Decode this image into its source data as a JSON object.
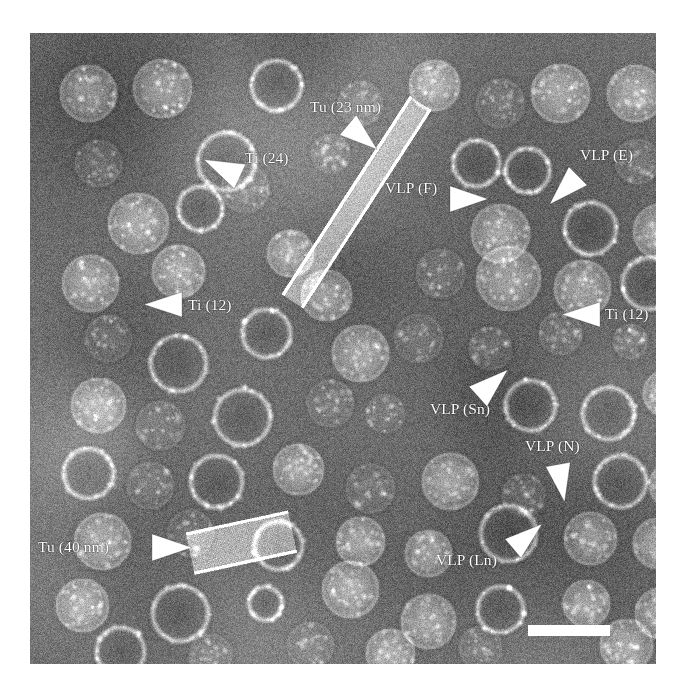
{
  "figure": {
    "type": "negative-stain-transmission-electron-micrograph",
    "plate": {
      "x": 30,
      "y": 33,
      "width": 626,
      "height": 631,
      "background_hex": "#6f6f6f",
      "border_hex": "#ffffff"
    },
    "annotation_color_hex": "#ffffff"
  },
  "annotations": [
    {
      "id": "tu-23nm",
      "label": "Tu (23 nm)",
      "text_x": 310,
      "text_y": 99,
      "arrow": {
        "x": 348,
        "y": 112,
        "angle": 40,
        "length": 38,
        "width": 26
      }
    },
    {
      "id": "ti-24",
      "label": "Ti (24)",
      "text_x": 245,
      "text_y": 150,
      "arrow": {
        "x": 240,
        "y": 163,
        "angle": 205,
        "length": 40,
        "width": 27
      }
    },
    {
      "id": "vlp-f",
      "label": "VLP (F)",
      "text_x": 385,
      "text_y": 180,
      "arrow": {
        "x": 450,
        "y": 186,
        "angle": 0,
        "length": 38,
        "width": 26
      }
    },
    {
      "id": "vlp-e",
      "label": "VLP (E)",
      "text_x": 580,
      "text_y": 147,
      "arrow": {
        "x": 578,
        "y": 163,
        "angle": 135,
        "length": 40,
        "width": 26
      }
    },
    {
      "id": "ti-12-left",
      "label": "Ti (12)",
      "text_x": 188,
      "text_y": 297,
      "arrow": {
        "x": 182,
        "y": 292,
        "angle": 180,
        "length": 38,
        "width": 25
      }
    },
    {
      "id": "ti-12-right",
      "label": "Ti (12)",
      "text_x": 605,
      "text_y": 306,
      "arrow": {
        "x": 600,
        "y": 302,
        "angle": 180,
        "length": 38,
        "width": 25
      }
    },
    {
      "id": "vlp-sn",
      "label": "VLP (Sn)",
      "text_x": 430,
      "text_y": 401,
      "arrow": {
        "x": 478,
        "y": 383,
        "angle": 318,
        "length": 40,
        "width": 27
      }
    },
    {
      "id": "vlp-n",
      "label": "VLP (N)",
      "text_x": 525,
      "text_y": 438,
      "arrow": {
        "x": 558,
        "y": 452,
        "angle": 80,
        "length": 38,
        "width": 25
      }
    },
    {
      "id": "vlp-ln",
      "label": "VLP (Ln)",
      "text_x": 436,
      "text_y": 552,
      "arrow": {
        "x": 513,
        "y": 536,
        "angle": 320,
        "length": 38,
        "width": 25
      }
    },
    {
      "id": "tu-40nm",
      "label": "Tu (40 nm)",
      "text_x": 38,
      "text_y": 539,
      "arrow": {
        "x": 152,
        "y": 534,
        "angle": 0,
        "length": 40,
        "width": 27
      }
    }
  ],
  "scale_bar": {
    "x": 528,
    "y": 625,
    "width": 82,
    "height": 11,
    "color_hex": "#ffffff",
    "label": ""
  },
  "micrograph_content": {
    "background_levels": {
      "mean": 112,
      "noise_sigma": 26
    },
    "particle_kinds": {
      "filled": "bright granular virus-like particle (stain-excluded core)",
      "ring": "annular / empty particle (stain-penetrated centre, bright rim)",
      "faint": "small low-contrast particle"
    },
    "particles": [
      {
        "cx": 58,
        "cy": 60,
        "r": 29,
        "kind": "filled"
      },
      {
        "cx": 132,
        "cy": 55,
        "r": 30,
        "kind": "filled"
      },
      {
        "cx": 246,
        "cy": 52,
        "r": 27,
        "kind": "ring"
      },
      {
        "cx": 330,
        "cy": 70,
        "r": 23,
        "kind": "faint"
      },
      {
        "cx": 404,
        "cy": 52,
        "r": 26,
        "kind": "filled"
      },
      {
        "cx": 470,
        "cy": 70,
        "r": 25,
        "kind": "faint"
      },
      {
        "cx": 530,
        "cy": 60,
        "r": 30,
        "kind": "filled"
      },
      {
        "cx": 605,
        "cy": 60,
        "r": 29,
        "kind": "filled"
      },
      {
        "cx": 68,
        "cy": 130,
        "r": 24,
        "kind": "faint"
      },
      {
        "cx": 196,
        "cy": 128,
        "r": 31,
        "kind": "ring"
      },
      {
        "cx": 300,
        "cy": 120,
        "r": 20,
        "kind": "faint"
      },
      {
        "cx": 446,
        "cy": 130,
        "r": 25,
        "kind": "ring"
      },
      {
        "cx": 497,
        "cy": 137,
        "r": 24,
        "kind": "ring"
      },
      {
        "cx": 607,
        "cy": 128,
        "r": 23,
        "kind": "faint"
      },
      {
        "cx": 108,
        "cy": 190,
        "r": 31,
        "kind": "filled"
      },
      {
        "cx": 170,
        "cy": 175,
        "r": 24,
        "kind": "ring"
      },
      {
        "cx": 215,
        "cy": 155,
        "r": 25,
        "kind": "faint"
      },
      {
        "cx": 470,
        "cy": 200,
        "r": 30,
        "kind": "filled"
      },
      {
        "cx": 560,
        "cy": 195,
        "r": 28,
        "kind": "ring"
      },
      {
        "cx": 630,
        "cy": 198,
        "r": 28,
        "kind": "filled"
      },
      {
        "cx": 60,
        "cy": 250,
        "r": 29,
        "kind": "filled"
      },
      {
        "cx": 148,
        "cy": 238,
        "r": 27,
        "kind": "filled"
      },
      {
        "cx": 296,
        "cy": 262,
        "r": 26,
        "kind": "filled"
      },
      {
        "cx": 410,
        "cy": 240,
        "r": 25,
        "kind": "faint"
      },
      {
        "cx": 478,
        "cy": 245,
        "r": 33,
        "kind": "filled"
      },
      {
        "cx": 552,
        "cy": 255,
        "r": 29,
        "kind": "filled"
      },
      {
        "cx": 618,
        "cy": 250,
        "r": 28,
        "kind": "ring"
      },
      {
        "cx": 78,
        "cy": 305,
        "r": 24,
        "kind": "faint"
      },
      {
        "cx": 148,
        "cy": 330,
        "r": 30,
        "kind": "ring"
      },
      {
        "cx": 236,
        "cy": 300,
        "r": 26,
        "kind": "ring"
      },
      {
        "cx": 330,
        "cy": 320,
        "r": 29,
        "kind": "filled"
      },
      {
        "cx": 388,
        "cy": 305,
        "r": 25,
        "kind": "faint"
      },
      {
        "cx": 460,
        "cy": 315,
        "r": 22,
        "kind": "faint"
      },
      {
        "cx": 530,
        "cy": 300,
        "r": 22,
        "kind": "faint"
      },
      {
        "cx": 600,
        "cy": 308,
        "r": 18,
        "kind": "faint"
      },
      {
        "cx": 68,
        "cy": 372,
        "r": 28,
        "kind": "filled"
      },
      {
        "cx": 130,
        "cy": 392,
        "r": 25,
        "kind": "faint"
      },
      {
        "cx": 212,
        "cy": 384,
        "r": 30,
        "kind": "ring"
      },
      {
        "cx": 300,
        "cy": 370,
        "r": 24,
        "kind": "faint"
      },
      {
        "cx": 355,
        "cy": 380,
        "r": 20,
        "kind": "faint"
      },
      {
        "cx": 500,
        "cy": 372,
        "r": 27,
        "kind": "ring"
      },
      {
        "cx": 578,
        "cy": 380,
        "r": 28,
        "kind": "ring"
      },
      {
        "cx": 636,
        "cy": 360,
        "r": 24,
        "kind": "filled"
      },
      {
        "cx": 58,
        "cy": 440,
        "r": 27,
        "kind": "ring"
      },
      {
        "cx": 120,
        "cy": 452,
        "r": 24,
        "kind": "faint"
      },
      {
        "cx": 186,
        "cy": 448,
        "r": 28,
        "kind": "ring"
      },
      {
        "cx": 268,
        "cy": 436,
        "r": 26,
        "kind": "filled"
      },
      {
        "cx": 340,
        "cy": 455,
        "r": 25,
        "kind": "faint"
      },
      {
        "cx": 420,
        "cy": 448,
        "r": 29,
        "kind": "filled"
      },
      {
        "cx": 493,
        "cy": 462,
        "r": 22,
        "kind": "faint"
      },
      {
        "cx": 590,
        "cy": 448,
        "r": 28,
        "kind": "ring"
      },
      {
        "cx": 642,
        "cy": 452,
        "r": 24,
        "kind": "filled"
      },
      {
        "cx": 72,
        "cy": 508,
        "r": 29,
        "kind": "filled"
      },
      {
        "cx": 160,
        "cy": 500,
        "r": 24,
        "kind": "faint"
      },
      {
        "cx": 248,
        "cy": 512,
        "r": 26,
        "kind": "ring"
      },
      {
        "cx": 330,
        "cy": 508,
        "r": 25,
        "kind": "filled"
      },
      {
        "cx": 398,
        "cy": 520,
        "r": 24,
        "kind": "filled"
      },
      {
        "cx": 478,
        "cy": 500,
        "r": 30,
        "kind": "ring"
      },
      {
        "cx": 560,
        "cy": 505,
        "r": 27,
        "kind": "filled"
      },
      {
        "cx": 628,
        "cy": 510,
        "r": 26,
        "kind": "filled"
      },
      {
        "cx": 52,
        "cy": 572,
        "r": 27,
        "kind": "filled"
      },
      {
        "cx": 150,
        "cy": 580,
        "r": 30,
        "kind": "ring"
      },
      {
        "cx": 235,
        "cy": 570,
        "r": 18,
        "kind": "ring"
      },
      {
        "cx": 320,
        "cy": 556,
        "r": 29,
        "kind": "filled"
      },
      {
        "cx": 398,
        "cy": 588,
        "r": 28,
        "kind": "filled"
      },
      {
        "cx": 470,
        "cy": 576,
        "r": 25,
        "kind": "ring"
      },
      {
        "cx": 556,
        "cy": 570,
        "r": 24,
        "kind": "filled"
      },
      {
        "cx": 630,
        "cy": 580,
        "r": 26,
        "kind": "filled"
      },
      {
        "cx": 90,
        "cy": 618,
        "r": 26,
        "kind": "ring"
      },
      {
        "cx": 180,
        "cy": 622,
        "r": 22,
        "kind": "faint"
      },
      {
        "cx": 280,
        "cy": 612,
        "r": 24,
        "kind": "faint"
      },
      {
        "cx": 360,
        "cy": 620,
        "r": 25,
        "kind": "filled"
      },
      {
        "cx": 450,
        "cy": 614,
        "r": 22,
        "kind": "faint"
      },
      {
        "cx": 596,
        "cy": 612,
        "r": 27,
        "kind": "filled"
      },
      {
        "cx": 260,
        "cy": 220,
        "r": 24,
        "kind": "filled"
      }
    ],
    "tubules": [
      {
        "id": "tu-23nm-tubule",
        "x1": 390,
        "y1": 70,
        "x2": 262,
        "y2": 268,
        "thickness": 23,
        "note": "narrow tubule, 23 nm"
      },
      {
        "id": "tu-40nm-tubule",
        "x1": 160,
        "y1": 520,
        "x2": 262,
        "y2": 498,
        "thickness": 40,
        "note": "wide tubule, 40 nm"
      }
    ]
  }
}
